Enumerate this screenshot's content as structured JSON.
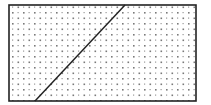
{
  "diagram": {
    "type": "geometric-figure",
    "shape": "rectangle",
    "fill": "dot-pattern",
    "rectangle": {
      "x": 9,
      "y": 5,
      "width": 187,
      "height": 96
    },
    "diagonal_line": {
      "x1": 35,
      "y1": 101,
      "x2": 125,
      "y2": 5
    },
    "colors": {
      "stroke": "#222222",
      "dots": "#7a7a7a",
      "background": "#ffffff"
    },
    "dot_spacing": 5.5
  }
}
